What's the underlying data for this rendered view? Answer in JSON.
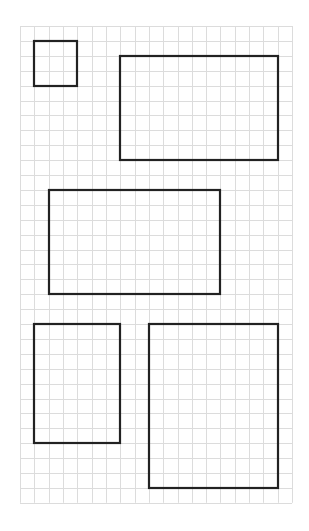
{
  "diagram": {
    "type": "grid-rectangles",
    "grid": {
      "cols": 19,
      "rows": 32,
      "origin_x": 20,
      "origin_y": 26,
      "cell_w": 14.32,
      "cell_h": 14.9,
      "line_color": "#dcdcdc"
    },
    "stroke_color": "#222222",
    "rectangles": [
      {
        "id": "rect-1",
        "col": 1,
        "row": 1,
        "w": 3,
        "h": 3
      },
      {
        "id": "rect-2",
        "col": 7,
        "row": 2,
        "w": 11,
        "h": 7
      },
      {
        "id": "rect-3",
        "col": 2,
        "row": 11,
        "w": 12,
        "h": 7
      },
      {
        "id": "rect-4",
        "col": 1,
        "row": 20,
        "w": 6,
        "h": 8
      },
      {
        "id": "rect-5",
        "col": 9,
        "row": 20,
        "w": 9,
        "h": 11
      }
    ]
  }
}
